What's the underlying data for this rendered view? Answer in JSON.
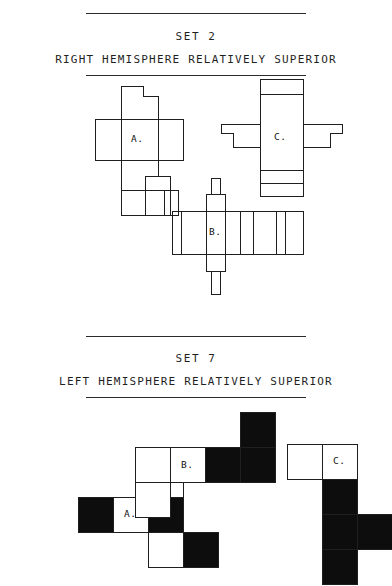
{
  "sections": [
    {
      "set_label": "SET 2",
      "hemisphere_label": "RIGHT HEMISPHERE RELATIVELY SUPERIOR",
      "style": "outline",
      "figures": [
        {
          "id": "A",
          "label": "A."
        },
        {
          "id": "B",
          "label": "B."
        },
        {
          "id": "C",
          "label": "C."
        }
      ]
    },
    {
      "set_label": "SET 7",
      "hemisphere_label": "LEFT HEMISPHERE RELATIVELY SUPERIOR",
      "style": "black-and-white-blocks",
      "figures": [
        {
          "id": "A",
          "label": "A."
        },
        {
          "id": "B",
          "label": "B."
        },
        {
          "id": "C",
          "label": "C."
        }
      ]
    }
  ],
  "colors": {
    "ink": "#1f1f1f",
    "rule": "#2b2b2b",
    "fill_black": "#0d0d0d",
    "fill_white": "#ffffff",
    "background": "#ffffff"
  }
}
